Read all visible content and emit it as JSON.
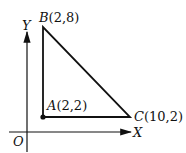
{
  "diagram": {
    "axes": {
      "x_label": "X",
      "y_label": "Y",
      "origin_label": "O"
    },
    "points": [
      {
        "name": "A",
        "label": "A(2,2)",
        "coords": [
          2,
          2
        ]
      },
      {
        "name": "B",
        "label": "B(2,8)",
        "coords": [
          2,
          8
        ]
      },
      {
        "name": "C",
        "label": "C(10,2)",
        "coords": [
          10,
          2
        ]
      }
    ],
    "shape": "right triangle ABC",
    "colors": {
      "stroke": "#111111",
      "background": "#ffffff"
    }
  }
}
